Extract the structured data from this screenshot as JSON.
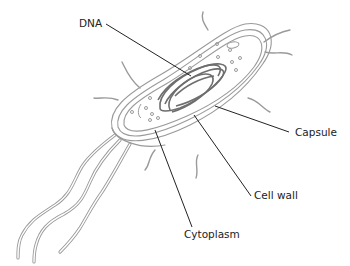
{
  "diagram": {
    "labels": [
      {
        "id": "dna",
        "text": "DNA"
      },
      {
        "id": "capsule",
        "text": "Capsule"
      },
      {
        "id": "cell-wall",
        "text": "Cell wall"
      },
      {
        "id": "cytoplasm",
        "text": "Cytoplasm"
      }
    ]
  },
  "colors": {
    "outline": "#9a9a9a",
    "dna": "#6e6e6e",
    "leader": "#222222",
    "text": "#222222"
  }
}
